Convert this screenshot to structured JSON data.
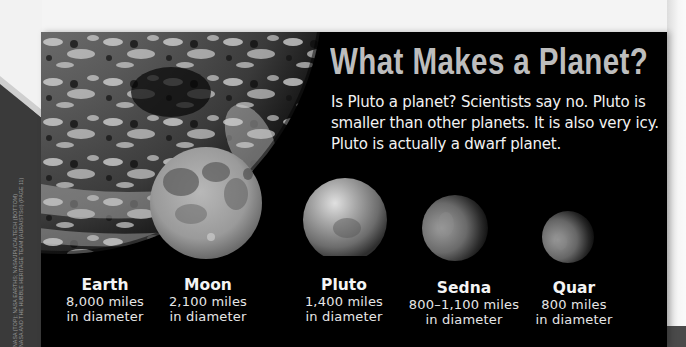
{
  "page": {
    "title": "What Makes a Planet?",
    "intro": "Is Pluto a planet? Scientists say no. Pluto is smaller than other planets. It is also very icy. Pluto is actually a dwarf planet.",
    "photo_credit_lines": [
      "NASA (TOP); NASA EARTHS; NASA/JPL/CALTECH (BOTTOM)",
      "NASA AND THE HUBBLE HERITAGE TEAM (AURA/STScI) (PAGE 11)"
    ]
  },
  "bodies": [
    {
      "name": "Earth",
      "size": "8,000 miles",
      "unit": "in diameter",
      "icon": "earth-image"
    },
    {
      "name": "Moon",
      "size": "2,100 miles",
      "unit": "in diameter",
      "icon": "moon-image"
    },
    {
      "name": "Pluto",
      "size": "1,400 miles",
      "unit": "in diameter",
      "icon": "pluto-image"
    },
    {
      "name": "Sedna",
      "size": "800–1,100 miles",
      "unit": "in diameter",
      "icon": "sedna-image"
    },
    {
      "name": "Quar",
      "size": "800 miles",
      "unit": "in diameter",
      "icon": "quaoar-image"
    }
  ],
  "colors": {
    "panel_background": "#000000",
    "title": "#bdbdbd",
    "body_text": "#f2f2f2"
  }
}
